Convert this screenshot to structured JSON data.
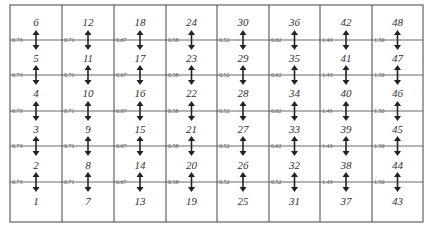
{
  "diagram": {
    "columns": [
      {
        "numbers": [
          6,
          5,
          4,
          3,
          2,
          1
        ],
        "boundary_values": [
          "0.73",
          "0.73",
          "0.73",
          "0.73",
          "0.73"
        ]
      },
      {
        "numbers": [
          12,
          11,
          10,
          9,
          8,
          7
        ],
        "boundary_values": [
          "0.71",
          "0.71",
          "0.71",
          "0.71",
          "0.71"
        ]
      },
      {
        "numbers": [
          18,
          17,
          16,
          15,
          14,
          13
        ],
        "boundary_values": [
          "0.67",
          "0.67",
          "0.67",
          "0.67",
          "0.67"
        ]
      },
      {
        "numbers": [
          24,
          23,
          22,
          21,
          20,
          19
        ],
        "boundary_values": [
          "0.58",
          "0.58",
          "0.58",
          "0.58",
          "0.58"
        ]
      },
      {
        "numbers": [
          30,
          29,
          28,
          27,
          26,
          25
        ],
        "boundary_values": [
          "0.52",
          "0.52",
          "0.52",
          "0.52",
          "0.52"
        ]
      },
      {
        "numbers": [
          36,
          35,
          34,
          33,
          32,
          31
        ],
        "boundary_values": [
          "0.62",
          "0.62",
          "0.62",
          "0.62",
          "0.52"
        ]
      },
      {
        "numbers": [
          42,
          41,
          40,
          39,
          38,
          37
        ],
        "boundary_values": [
          "1.43",
          "1.43",
          "1.43",
          "1.43",
          "1.43"
        ]
      },
      {
        "numbers": [
          48,
          47,
          46,
          45,
          44,
          43
        ],
        "boundary_values": [
          "1.50",
          "1.50",
          "1.50",
          "1.50",
          "1.50"
        ]
      }
    ],
    "arrow_icon": "double-headed-vertical-arrow",
    "colors": {
      "line": "#444444",
      "text": "#333333",
      "arrow": "#222222"
    }
  }
}
